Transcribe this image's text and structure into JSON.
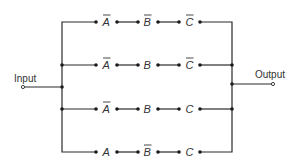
{
  "diagram": {
    "input_label": "Input",
    "output_label": "Output",
    "rows": [
      {
        "terms": [
          {
            "var": "A",
            "negated": true
          },
          {
            "var": "B",
            "negated": true
          },
          {
            "var": "C",
            "negated": true
          }
        ]
      },
      {
        "terms": [
          {
            "var": "A",
            "negated": true
          },
          {
            "var": "B",
            "negated": false
          },
          {
            "var": "C",
            "negated": true
          }
        ]
      },
      {
        "terms": [
          {
            "var": "A",
            "negated": true
          },
          {
            "var": "B",
            "negated": false
          },
          {
            "var": "C",
            "negated": false
          }
        ]
      },
      {
        "terms": [
          {
            "var": "A",
            "negated": false
          },
          {
            "var": "B",
            "negated": true
          },
          {
            "var": "C",
            "negated": false
          }
        ]
      }
    ]
  }
}
